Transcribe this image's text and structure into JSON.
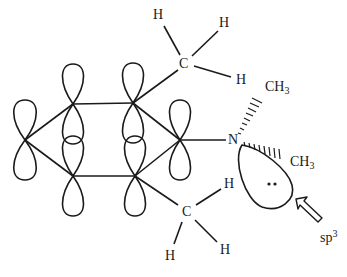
{
  "diagram": {
    "type": "molecular-orbital-diagram",
    "colors": {
      "line": "#1a1a1a",
      "background": "#ffffff"
    },
    "labels": {
      "top_methyl": {
        "carbon": "C",
        "h1": "H",
        "h2": "H",
        "h3": "H"
      },
      "bottom_methyl": {
        "carbon": "C",
        "h1": "H",
        "h2": "H",
        "h3": "H"
      },
      "nitrogen": "N",
      "n_methyl_upper": {
        "base": "CH",
        "sub": "3"
      },
      "n_methyl_lower": {
        "base": "CH",
        "sub": "3"
      },
      "lone_pair_dots": "••",
      "hybridization": {
        "base": "sp",
        "sup": "3"
      }
    },
    "nodes": [
      {
        "id": "ring-left",
        "x": 25,
        "y": 140
      },
      {
        "id": "ring-upper-left",
        "x": 73,
        "y": 104
      },
      {
        "id": "ring-lower-left",
        "x": 73,
        "y": 176
      },
      {
        "id": "ring-upper-right",
        "x": 133,
        "y": 103
      },
      {
        "id": "ring-lower-right",
        "x": 135,
        "y": 176
      },
      {
        "id": "ring-right",
        "x": 180,
        "y": 140
      },
      {
        "id": "nitrogen",
        "x": 234,
        "y": 140
      },
      {
        "id": "top-carbon",
        "x": 185,
        "y": 64
      },
      {
        "id": "bottom-carbon",
        "x": 187,
        "y": 212
      }
    ]
  }
}
